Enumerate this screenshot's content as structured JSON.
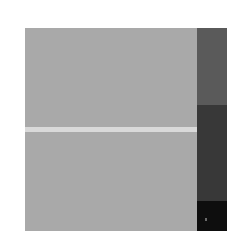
{
  "figure": {
    "panel": {
      "color": "#a9a9a9"
    },
    "stripe": {
      "color": "#d9d9d9"
    },
    "side_bar": {
      "segments": [
        {
          "name": "top",
          "color": "#5a5a5a"
        },
        {
          "name": "middle",
          "color": "#383838"
        },
        {
          "name": "bottom",
          "color": "#0e0e0e"
        }
      ]
    }
  }
}
